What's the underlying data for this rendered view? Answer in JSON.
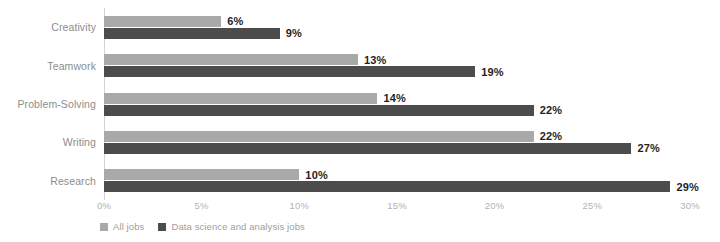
{
  "chart_data": {
    "type": "bar",
    "orientation": "horizontal",
    "title": "",
    "subtitle": "",
    "xlabel": "",
    "ylabel": "",
    "categories": [
      "Creativity",
      "Teamwork",
      "Problem-Solving",
      "Writing",
      "Research"
    ],
    "series": [
      {
        "name": "All jobs",
        "color": "#a9a9a9",
        "values": [
          6,
          13,
          14,
          22,
          10
        ],
        "labels": [
          "6%",
          "13%",
          "14%",
          "22%",
          "10%"
        ]
      },
      {
        "name": "Data science and analysis jobs",
        "color": "#4c4c4c",
        "values": [
          9,
          19,
          22,
          27,
          29
        ],
        "labels": [
          "9%",
          "19%",
          "22%",
          "27%",
          "29%"
        ]
      }
    ],
    "xlim": [
      0,
      30
    ],
    "xticks": [
      0,
      5,
      10,
      15,
      20,
      25,
      30
    ],
    "xtick_labels": [
      "0%",
      "5%",
      "10%",
      "15%",
      "20%",
      "25%",
      "30%"
    ],
    "grid": false,
    "legend_position": "bottom-left",
    "value_labels_shown": true,
    "value_label_suffix": "%"
  },
  "axis": {
    "axis_line_color": "#d4d4d4",
    "tick_label_color": "#b3b3b3",
    "category_label_color": "#8d8d8d",
    "value_label_color": "#1f1f1f"
  },
  "legend": {
    "items": [
      {
        "label": "All jobs",
        "color": "#a9a9a9"
      },
      {
        "label": "Data science and analysis jobs",
        "color": "#4c4c4c"
      }
    ]
  }
}
